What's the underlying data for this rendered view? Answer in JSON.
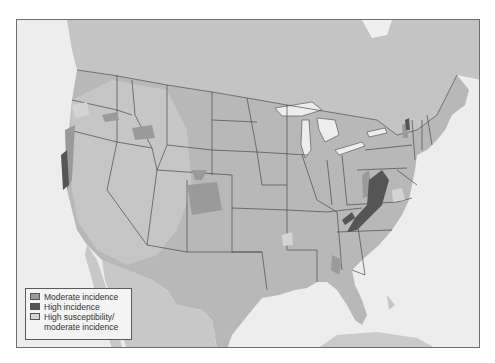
{
  "map": {
    "region": "Contiguous United States",
    "style": "grayscale shaded relief with state boundaries"
  },
  "legend": {
    "items": [
      {
        "label": "Moderate incidence",
        "color": "#9a9a9a"
      },
      {
        "label": "High incidence",
        "color": "#555555"
      },
      {
        "label": "High susceptibility/",
        "label2": "moderate incidence",
        "color": "#d4d4d4"
      }
    ]
  },
  "colors": {
    "water": "#ededed",
    "land": "#b9b9b9",
    "relief_light": "#cdcdcd",
    "foreign_land": "#c6c6c6",
    "border": "#4a4a4a",
    "frame": "#6e6e6e"
  }
}
